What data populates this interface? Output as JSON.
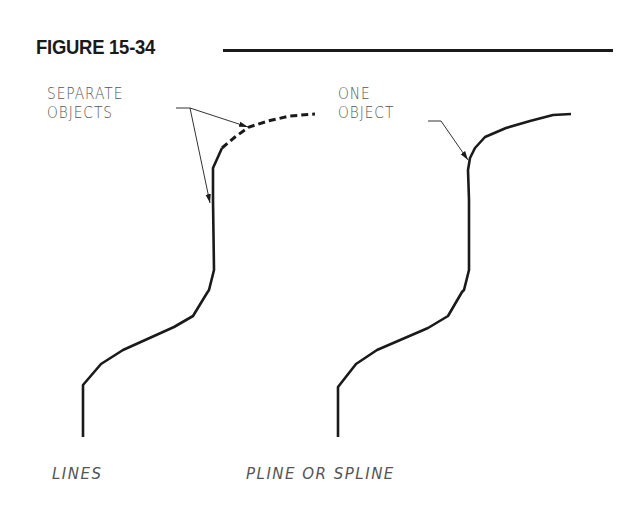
{
  "figure": {
    "title": "FIGURE 15-34"
  },
  "left_panel": {
    "annotation_line1": "SEPARATE",
    "annotation_line2": "OBJECTS",
    "caption": "LINES",
    "segments": [
      "solid-polyline",
      "dashed-arc"
    ]
  },
  "right_panel": {
    "annotation_line1": "ONE",
    "annotation_line2": "OBJECT",
    "caption": "PLINE OR SPLINE",
    "segments": [
      "single-continuous-curve"
    ]
  },
  "colors": {
    "ink": "#1a1a1a",
    "label_text": "#555555",
    "background": "#ffffff"
  }
}
